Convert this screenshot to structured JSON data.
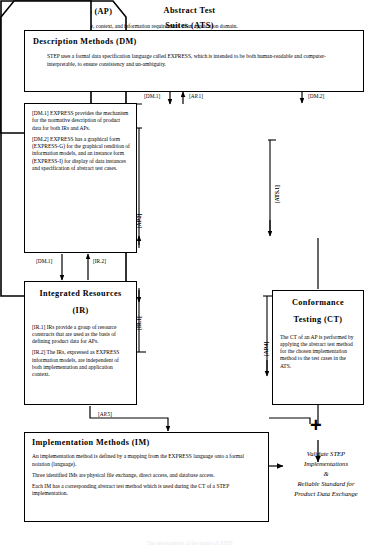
{
  "diagram": {
    "title_caption": "The development of the model of STEP",
    "boxes": {
      "dm": {
        "title": "Description Methods  (DM)",
        "body": [
          "STEP uses a formal data specification language called EXPRESS, which is intended to be both human-readable and computer-interpretable, to ensure consistency and un-ambiguity."
        ]
      },
      "dm_detail": {
        "body": [
          "[DM.1]  EXPRESS provides the mechanism for the normative description of product data for both IRs and APs.",
          "[DM.2]  EXPRESS has a graphical form (EXPRESS-G) for the graphical rendition of information models, and an instance form (EXPRESS-I) for display of data instances and specification of abstract test cases."
        ]
      },
      "ir": {
        "title_line1": "Integrated  Resources",
        "title_line2": "(IR)",
        "body": [
          "[IR.1]  IRs provide a group of resource constructs that are used as the basis of defining product data for APs.",
          "[IR.2]  The IRs, expressed as EXPRESS information models, are independent of both implementation and application context."
        ]
      },
      "ap": {
        "title": "Application  Protocols  (AP)",
        "body": [
          "An AP includes the definition of scope, context, and information requirements of an application domain.",
          "[AP.1]  The information requirements of an application are represented by a application interpreted model (AIM) using EXPRESS.",
          "[AP.2]  The AIM is assembled from resource constructs in the IRs (All the constructs used in the AIM are interpreted from the IRs).",
          "[AP.3]  Each AP has a corresponding ATS which is used during CT of a STEP implementation.",
          "[AP.4]  The AP defines the complete process for testing to establish the conformance of an implementation.",
          "[AP.5]  An AP is combined with an IM to form the basis of a STEP implementation."
        ]
      },
      "ats": {
        "title_line1": "Abstract  Test",
        "title_line2": "Suites    (ATS)",
        "body": [
          "[ATS.1]  An abstract test suite contains the complete set of abstract test cases for one or more APs."
        ]
      },
      "ct": {
        "title_line1": "Conformance",
        "title_line2": "Testing    (CT)",
        "body": [
          "The CT of an AP is performed by applying the abstract test method for the chosen implementation method to the test cases in the ATS."
        ]
      },
      "im": {
        "title": "Implementation  Methods  (IM)",
        "body": [
          "An implementation method is defined by a mapping from the EXPRESS language onto a formal notation (language).",
          "Three identified IMs are physical file exchange, direct access, and database access.",
          "Each IM has a corresponding abstract test method which is used during the CT of a STEP implementation."
        ]
      }
    },
    "goal": {
      "line1": "Validate STEP",
      "line2": "Implementations",
      "line3": "&",
      "line4": "Reliable Standard for",
      "line5": "Product Data Exchange"
    },
    "connectors": [
      {
        "id": "dm1-to-ap",
        "label": "[DM.1]"
      },
      {
        "id": "ap1-to-dm",
        "label": "[AP.1]"
      },
      {
        "id": "dm2-to-ats",
        "label": "[DM.2]"
      },
      {
        "id": "dm1-to-ir",
        "label": "[DM.1]"
      },
      {
        "id": "ir2-to-dm",
        "label": "[IR.2]"
      },
      {
        "id": "ap5-to-im",
        "label": "[AP.5]"
      },
      {
        "id": "ats1-side",
        "label": "[ATS.1]"
      },
      {
        "id": "ap2-side",
        "label": "[AP.2]"
      },
      {
        "id": "ir1-side",
        "label": "[IR.1]"
      },
      {
        "id": "ap4-side",
        "label": "[AP.4]"
      }
    ],
    "junction_symbol": "+",
    "colors": {
      "line": "#000000",
      "background": "#ffffff",
      "text": "#000000"
    }
  }
}
